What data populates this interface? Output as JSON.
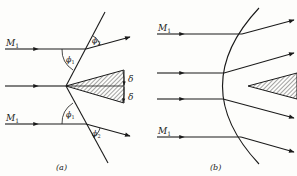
{
  "figure": {
    "panels": [
      {
        "id": "a",
        "caption": "(a)",
        "type": "oblique shock on wedge",
        "labels": {
          "upper_mach": "M",
          "upper_mach_sub": "1",
          "lower_mach": "M",
          "lower_mach_sub": "1",
          "phi1_upper": "ϕ",
          "phi1_upper_sub": "1",
          "phi2_upper": "ϕ",
          "phi2_upper_sub": "2",
          "phi1_lower": "ϕ",
          "phi1_lower_sub": "1",
          "phi2_lower": "ϕ",
          "phi2_lower_sub": "2",
          "delta_upper": "δ",
          "delta_lower": "δ"
        }
      },
      {
        "id": "b",
        "caption": "(b)",
        "type": "detached curved shock",
        "labels": {
          "upper_mach": "M",
          "upper_mach_sub": "1",
          "lower_mach": "M",
          "lower_mach_sub": "1"
        }
      }
    ],
    "colors": {
      "ink": "#1a1a1a",
      "background": "#fdfdfb"
    }
  }
}
